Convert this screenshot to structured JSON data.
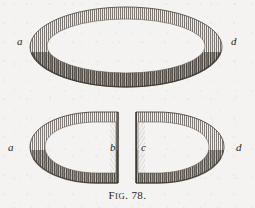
{
  "figure": {
    "caption_prefix": "F",
    "caption_smallcaps": "IG",
    "caption_suffix": ". 78.",
    "caption_full": "FIG. 78.",
    "number": "78",
    "background_color": "#f4f3f1",
    "ink_color": "#332e27",
    "style": "steel engraving hatched line drawing"
  },
  "shapes": {
    "upper": {
      "name": "whole-ellipse",
      "description": "complete shaded ellipse seen in perspective",
      "center_x": 126,
      "center_y": 47,
      "radius_x": 96,
      "radius_y": 40
    },
    "lower_left": {
      "name": "left-half-section",
      "description": "left half-section of the ellipse with flat cut edge at right",
      "cut_edge_x": 118
    },
    "lower_right": {
      "name": "right-half-section",
      "description": "right half-section of the ellipse with flat cut edge at left",
      "cut_edge_x": 136
    }
  },
  "labels": {
    "upper_left": {
      "text": "a",
      "x": 17,
      "y": 42
    },
    "upper_right": {
      "text": "d",
      "x": 231,
      "y": 42
    },
    "lower_left": {
      "text": "a",
      "x": 8,
      "y": 148
    },
    "lower_left_inner": {
      "text": "b",
      "x": 110,
      "y": 148
    },
    "lower_right_inner": {
      "text": "c",
      "x": 140,
      "y": 148
    },
    "lower_right": {
      "text": "d",
      "x": 236,
      "y": 148
    }
  }
}
